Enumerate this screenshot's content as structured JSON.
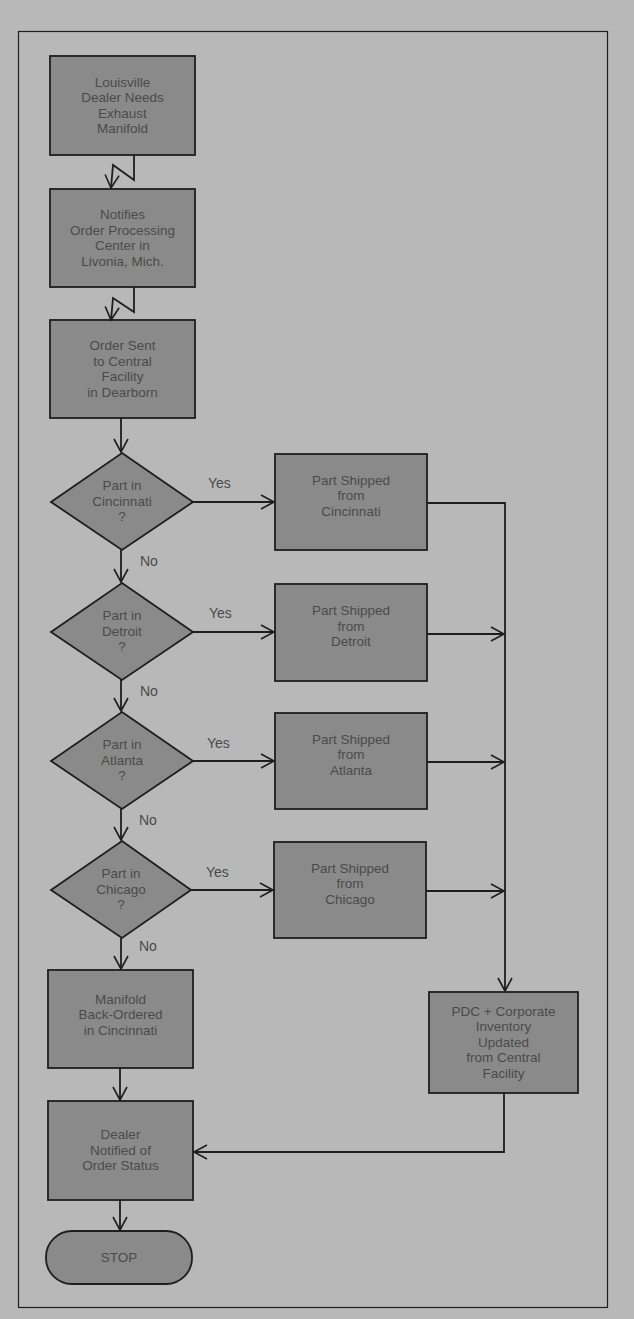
{
  "diagram": {
    "type": "flowchart",
    "colors": {
      "background": "#b8b8b8",
      "node_fill": "#8a8a8a",
      "stroke": "#1e1e1e",
      "text": "#4a4a4a"
    },
    "nodes": {
      "n1": "Louisville\nDealer Needs\nExhaust\nManifold",
      "n2": "Notifies\nOrder Processing\nCenter in\nLivonia, Mich.",
      "n3": "Order Sent\nto Central\nFacility\nin Dearborn",
      "d1": "Part in\nCincinnati\n?",
      "d2": "Part in\nDetroit\n?",
      "d3": "Part in\nAtlanta\n?",
      "d4": "Part in\nChicago\n?",
      "s1": "Part Shipped\nfrom\nCincinnati",
      "s2": "Part Shipped\nfrom\nDetroit",
      "s3": "Part Shipped\nfrom\nAtlanta",
      "s4": "Part Shipped\nfrom\nChicago",
      "bo": "Manifold\nBack-Ordered\nin Cincinnati",
      "pdc": "PDC + Corporate\nInventory\nUpdated\nfrom Central\nFacility",
      "notify": "Dealer\nNotified of\nOrder Status",
      "stop": "STOP"
    },
    "edge_labels": {
      "yes": "Yes",
      "no": "No"
    }
  }
}
